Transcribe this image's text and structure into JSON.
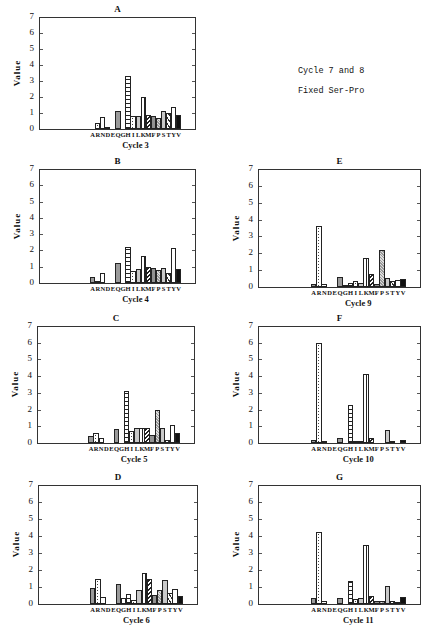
{
  "note": {
    "line1": "Cycle 7 and 8",
    "line2": "Fixed Ser-Pro"
  },
  "ylabel": "Value",
  "yticks": [
    "0",
    "1",
    "2",
    "3",
    "4",
    "5",
    "6",
    "7"
  ],
  "xlabels": [
    "A",
    "R",
    "N",
    "D",
    "E",
    "Q",
    "G",
    "H",
    "I",
    "L",
    "K",
    "M",
    "F",
    "P",
    "S",
    "T",
    "Y",
    "V"
  ],
  "chart_data": [
    {
      "type": "bar",
      "title": "A",
      "xlabel": "Cycle 3",
      "ylabel": "Value",
      "ylim": [
        0,
        7
      ],
      "categories": [
        "A",
        "R",
        "N",
        "D",
        "E",
        "Q",
        "G",
        "H",
        "I",
        "L",
        "K",
        "M",
        "F",
        "P",
        "S",
        "T",
        "Y",
        "V"
      ],
      "values": [
        0,
        0.4,
        0.75,
        0.15,
        0,
        1.1,
        0,
        3.3,
        0.8,
        0.8,
        2.0,
        0.9,
        0.8,
        0.7,
        1.15,
        1.0,
        1.4,
        0.85
      ]
    },
    {
      "type": "bar",
      "title": "B",
      "xlabel": "Cycle 4",
      "ylabel": "Value",
      "ylim": [
        0,
        7
      ],
      "categories": [
        "A",
        "R",
        "N",
        "D",
        "E",
        "Q",
        "G",
        "H",
        "I",
        "L",
        "K",
        "M",
        "F",
        "P",
        "S",
        "T",
        "Y",
        "V"
      ],
      "values": [
        0.35,
        0.1,
        0.6,
        0,
        0,
        1.2,
        0,
        2.2,
        0.75,
        0.85,
        1.65,
        1.0,
        0.9,
        0.8,
        0.95,
        0.6,
        2.15,
        0.85
      ]
    },
    {
      "type": "bar",
      "title": "C",
      "xlabel": "Cycle 5",
      "ylabel": "Value",
      "ylim": [
        0,
        7
      ],
      "categories": [
        "A",
        "R",
        "N",
        "D",
        "E",
        "Q",
        "G",
        "H",
        "I",
        "L",
        "K",
        "M",
        "F",
        "P",
        "S",
        "T",
        "Y",
        "V"
      ],
      "values": [
        0.4,
        0.6,
        0.3,
        0,
        0,
        0.85,
        0,
        3.1,
        0.7,
        0.9,
        0.9,
        0.9,
        0.5,
        1.95,
        0.9,
        0.2,
        1.05,
        0.6
      ]
    },
    {
      "type": "bar",
      "title": "D",
      "xlabel": "Cycle 6",
      "ylabel": "Value",
      "ylim": [
        0,
        7
      ],
      "categories": [
        "A",
        "R",
        "N",
        "D",
        "E",
        "Q",
        "G",
        "H",
        "I",
        "L",
        "K",
        "M",
        "F",
        "P",
        "S",
        "T",
        "Y",
        "V"
      ],
      "values": [
        0.95,
        1.45,
        0.4,
        0,
        0,
        1.2,
        0.35,
        0.6,
        0.25,
        0.8,
        1.85,
        1.45,
        0.55,
        0.8,
        1.4,
        0.65,
        0.9,
        0.5
      ]
    },
    {
      "type": "bar",
      "title": "E",
      "xlabel": "Cycle 9",
      "ylabel": "Value",
      "ylim": [
        0,
        7
      ],
      "categories": [
        "A",
        "R",
        "N",
        "D",
        "E",
        "Q",
        "G",
        "H",
        "I",
        "L",
        "K",
        "M",
        "F",
        "P",
        "S",
        "T",
        "Y",
        "V"
      ],
      "values": [
        0.2,
        3.6,
        0.15,
        0,
        0,
        0.6,
        0.1,
        0.25,
        0.35,
        0.25,
        1.7,
        0.8,
        0.2,
        2.2,
        0.55,
        0.35,
        0.4,
        0.5
      ]
    },
    {
      "type": "bar",
      "title": "F",
      "xlabel": "Cycle 10",
      "ylabel": "Value",
      "ylim": [
        0,
        7
      ],
      "categories": [
        "A",
        "R",
        "N",
        "D",
        "E",
        "Q",
        "G",
        "H",
        "I",
        "L",
        "K",
        "M",
        "F",
        "P",
        "S",
        "T",
        "Y",
        "V"
      ],
      "values": [
        0.15,
        6.0,
        0.05,
        0,
        0,
        0.3,
        0,
        2.3,
        0.1,
        0.1,
        4.15,
        0.3,
        0,
        0,
        0.75,
        0.05,
        0,
        0.2
      ]
    },
    {
      "type": "bar",
      "title": "G",
      "xlabel": "Cycle 11",
      "ylabel": "Value",
      "ylim": [
        0,
        7
      ],
      "categories": [
        "A",
        "R",
        "N",
        "D",
        "E",
        "Q",
        "G",
        "H",
        "I",
        "L",
        "K",
        "M",
        "F",
        "P",
        "S",
        "T",
        "Y",
        "V"
      ],
      "values": [
        0.35,
        4.25,
        0.15,
        0,
        0,
        0.35,
        0,
        1.35,
        0.3,
        0.35,
        3.5,
        0.45,
        0.2,
        0.2,
        1.05,
        0.2,
        0.1,
        0.4
      ]
    }
  ],
  "patterns": [
    "p-gray",
    "p-dots",
    "p-white",
    "p-dark",
    "p-white",
    "p-gray",
    "p-white",
    "p-hstripe",
    "p-dots",
    "p-ltgray",
    "p-vstripe",
    "p-bdiag",
    "p-fdots",
    "p-check",
    "p-ltdot",
    "p-zig",
    "p-blocks",
    "p-black"
  ]
}
